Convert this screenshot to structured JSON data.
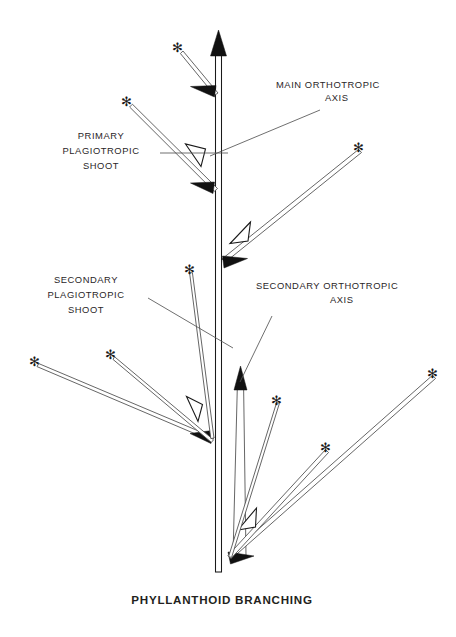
{
  "figure": {
    "caption": "PHYLLANTHOID BRANCHING",
    "background_color": "#ffffff",
    "ink_color": "#231f20"
  },
  "labels": [
    {
      "name": "main-orthotropic-axis",
      "lines": [
        "MAIN ORTHOTROPIC",
        "AXIS"
      ],
      "line1": "MAIN ORTHOTROPIC",
      "line2": "AXIS",
      "anchor_x": 276,
      "line1_y": 88,
      "line2_y": 101,
      "align": "start",
      "leader": {
        "x1": 320,
        "y1": 110,
        "x2": 210,
        "y2": 156
      }
    },
    {
      "name": "primary-plagiotropic-shoot",
      "lines": [
        "PRIMARY",
        "PLAGIOTROPIC",
        "SHOOT"
      ],
      "line1": "PRIMARY",
      "line2": "PLAGIOTROPIC",
      "line3": "SHOOT",
      "anchor_x": 101,
      "line1_y": 139,
      "line2_y": 154,
      "line3_y": 169,
      "align": "middle",
      "leader": {
        "x1": 160,
        "y1": 153,
        "x2": 228,
        "y2": 153
      }
    },
    {
      "name": "secondary-plagiotropic-shoot",
      "lines": [
        "SECONDARY",
        "PLAGIOTROPIC",
        "SHOOT"
      ],
      "line1": "SECONDARY",
      "line2": "PLAGIOTROPIC",
      "line3": "SHOOT",
      "anchor_x": 86,
      "line1_y": 283,
      "line2_y": 298,
      "line3_y": 313,
      "align": "middle",
      "leader": {
        "x1": 148,
        "y1": 298,
        "x2": 233,
        "y2": 348
      }
    },
    {
      "name": "secondary-orthotropic-axis",
      "lines": [
        "SECONDARY ORTHOTROPIC",
        "AXIS"
      ],
      "line1": "SECONDARY ORTHOTROPIC",
      "line2": "AXIS",
      "anchor_x": 256,
      "line1_y": 289,
      "line2_y": 303,
      "align": "start",
      "leader": {
        "x1": 272,
        "y1": 316,
        "x2": 240,
        "y2": 382
      }
    }
  ],
  "diagram": {
    "main_axis": {
      "name": "main-orthotropic-axis-stem",
      "x_left": 215.5,
      "x_right": 221.5,
      "y_top": 45,
      "y_bottom": 572,
      "arrowhead": "solid-up"
    },
    "secondary_axis": {
      "name": "secondary-orthotropic-axis-stem",
      "x_left": 239,
      "x_right": 245,
      "y_top": 380,
      "y_bottom": 556,
      "arrowhead": "solid-up"
    },
    "branches": [
      {
        "name": "branch-upper-left-1",
        "tip_x": 179,
        "tip_y": 50,
        "base_x": 216,
        "base_y": 92,
        "width": 2.6,
        "tip_marker": "asterisk",
        "node_head": "solid-left",
        "mid_head": "none"
      },
      {
        "name": "branch-upper-left-2",
        "tip_x": 128,
        "tip_y": 104,
        "base_x": 215,
        "base_y": 188,
        "width": 3.0,
        "tip_marker": "asterisk",
        "node_head": "solid-left",
        "mid_head": "hollow"
      },
      {
        "name": "branch-upper-right-1",
        "tip_x": 360,
        "tip_y": 150,
        "base_x": 222,
        "base_y": 262,
        "width": 3.0,
        "tip_marker": "asterisk",
        "node_head": "solid-right",
        "mid_head": "hollow"
      },
      {
        "name": "branch-mid-left-long",
        "tip_x": 36,
        "tip_y": 364,
        "base_x": 212,
        "base_y": 438,
        "width": 3.0,
        "tip_marker": "asterisk",
        "node_head": "solid-left",
        "mid_head": "hollow"
      },
      {
        "name": "branch-mid-left-short",
        "tip_x": 112,
        "tip_y": 357,
        "base_x": 212,
        "base_y": 440,
        "width": 2.4,
        "tip_marker": "asterisk",
        "node_head": "none",
        "mid_head": "none"
      },
      {
        "name": "branch-upper-mid-left",
        "tip_x": 191,
        "tip_y": 272,
        "base_x": 212,
        "base_y": 438,
        "width": 2.6,
        "tip_marker": "asterisk",
        "node_head": "none",
        "mid_head": "none"
      },
      {
        "name": "branch-lower-right-long",
        "tip_x": 434,
        "tip_y": 376,
        "base_x": 230,
        "base_y": 558,
        "width": 3.0,
        "tip_marker": "asterisk",
        "node_head": "solid-right",
        "mid_head": "none"
      },
      {
        "name": "branch-lower-right-short",
        "tip_x": 327,
        "tip_y": 450,
        "base_x": 229,
        "base_y": 558,
        "width": 2.8,
        "tip_marker": "asterisk",
        "node_head": "none",
        "mid_head": "hollow"
      },
      {
        "name": "branch-lower-mid-right",
        "tip_x": 278,
        "tip_y": 402,
        "base_x": 230,
        "base_y": 556,
        "width": 2.6,
        "tip_marker": "asterisk",
        "node_head": "none",
        "mid_head": "none"
      }
    ],
    "markers": {
      "asterisk_glyph": "✻",
      "solid_arrowhead": "solid-triangle",
      "hollow_arrowhead": "open-triangle"
    }
  }
}
